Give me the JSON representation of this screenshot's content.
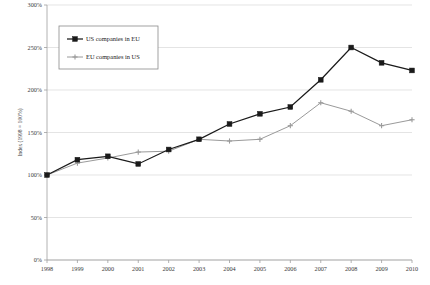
{
  "chart_data": {
    "type": "line",
    "title": "",
    "subtitle": "",
    "xlabel": "",
    "ylabel": "Index (1998 = 100%)",
    "categories": [
      "1998",
      "1999",
      "2000",
      "2001",
      "2002",
      "2003",
      "2004",
      "2005",
      "2006",
      "2007",
      "2008",
      "2009",
      "2010"
    ],
    "x": [
      1998,
      1999,
      2000,
      2001,
      2002,
      2003,
      2004,
      2005,
      2006,
      2007,
      2008,
      2009,
      2010
    ],
    "ylim": [
      0,
      300
    ],
    "yticks": [
      0,
      50,
      100,
      150,
      200,
      250,
      300
    ],
    "ytick_labels": [
      "0%",
      "50%",
      "100%",
      "150%",
      "200%",
      "250%",
      "300%"
    ],
    "grid": true,
    "grid_axis": "y",
    "legend_position": "top-left-inside",
    "series": [
      {
        "name": "US companies in EU",
        "color": "#1a1a1a",
        "marker": "square",
        "values": [
          100,
          118,
          122,
          113,
          130,
          142,
          160,
          172,
          180,
          212,
          250,
          232,
          223
        ]
      },
      {
        "name": "EU companies in US",
        "color": "#9a9a9a",
        "marker": "plus",
        "values": [
          100,
          114,
          120,
          127,
          128,
          142,
          140,
          142,
          158,
          185,
          175,
          158,
          165
        ]
      }
    ]
  },
  "legend": {
    "items": [
      {
        "label": "US companies in EU"
      },
      {
        "label": "EU companies in US"
      }
    ]
  },
  "colors": {
    "series_us_in_eu": "#1a1a1a",
    "series_eu_in_us": "#9a9a9a",
    "gridline": "#d8d8d8",
    "axis": "#9e9e9e",
    "text": "#3a3a3a",
    "background": "#ffffff"
  }
}
